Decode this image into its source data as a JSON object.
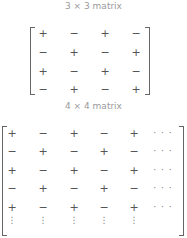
{
  "captions": {
    "top": "3 × 3 matrix",
    "bottom": "4 × 4 matrix"
  },
  "matrix_top": {
    "rows": [
      [
        "+",
        "−",
        "+",
        "−"
      ],
      [
        "−",
        "+",
        "−",
        "+"
      ],
      [
        "+",
        "−",
        "+",
        "−"
      ],
      [
        "−",
        "+",
        "−",
        "+"
      ]
    ]
  },
  "matrix_bottom": {
    "rows": [
      [
        "+",
        "−",
        "+",
        "−",
        "+",
        "· · ·"
      ],
      [
        "−",
        "+",
        "−",
        "+",
        "−",
        "· · ·"
      ],
      [
        "+",
        "−",
        "+",
        "−",
        "+",
        "· · ·"
      ],
      [
        "−",
        "+",
        "−",
        "+",
        "−",
        "· · ·"
      ],
      [
        "+",
        "−",
        "+",
        "−",
        "+",
        "· · ·"
      ]
    ],
    "vdots": [
      "⋮",
      "⋮",
      "⋮",
      "⋮",
      "⋮"
    ]
  }
}
